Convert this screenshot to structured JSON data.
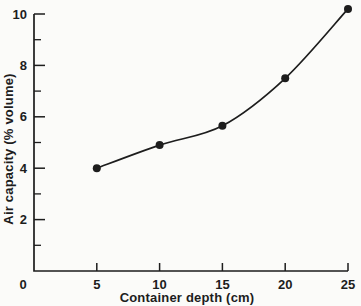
{
  "figure": {
    "background_color": "#fbfbf9",
    "ink_color": "#1d1d1d"
  },
  "chart_data": {
    "type": "line",
    "title": "",
    "xlabel": "Container depth (cm)",
    "ylabel": "Air capacity (% volume)",
    "x": [
      5,
      10,
      15,
      20,
      25
    ],
    "y": [
      4.0,
      4.9,
      5.65,
      7.5,
      10.2
    ],
    "series": [
      {
        "name": "Air capacity vs container depth",
        "x": [
          5,
          10,
          15,
          20,
          25
        ],
        "values": [
          4.0,
          4.9,
          5.65,
          7.5,
          10.2
        ]
      }
    ],
    "xlim": [
      0,
      25
    ],
    "ylim": [
      0,
      10
    ],
    "x_ticks": [
      0,
      5,
      10,
      15,
      20,
      25
    ],
    "y_major_ticks": [
      2,
      4,
      6,
      8,
      10
    ],
    "y_minor_ticks": [
      1,
      3,
      5,
      7,
      9
    ],
    "origin_label": "0",
    "marker": "filled-circle",
    "marker_radius_px": 4,
    "line_style": "smooth-curve",
    "grid": false,
    "legend": null
  }
}
